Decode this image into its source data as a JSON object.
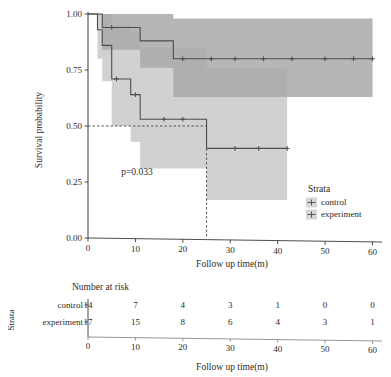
{
  "chart_data": {
    "type": "line",
    "plot_kind": "kaplan-meier-survival",
    "title": "",
    "xlabel": "Follow up time(m)",
    "ylabel": "Survival probability",
    "xlim": [
      0,
      62
    ],
    "ylim": [
      0.0,
      1.0
    ],
    "xticks": [
      0,
      10,
      20,
      30,
      40,
      50,
      60
    ],
    "xtick_labels": [
      "0",
      "10",
      "20",
      "30",
      "40",
      "50",
      "60"
    ],
    "yticks": [
      0.0,
      0.25,
      0.5,
      0.75,
      1.0
    ],
    "ytick_labels": [
      "0.00",
      "0.25",
      "0.50",
      "0.75",
      "1.00"
    ],
    "grid": false,
    "annotations": [
      {
        "name": "p-value",
        "text": "p=0.033",
        "x": 7,
        "y": 0.28
      }
    ],
    "median_reference": {
      "level": 0.5,
      "control_median_time": 25,
      "style": "dashed"
    },
    "legend": {
      "title": "Strata",
      "position": "right-bottom",
      "entries": [
        "control",
        "experiment"
      ]
    },
    "series": [
      {
        "name": "control",
        "color": "#4d4d4d",
        "band_color": "#c9c9c9",
        "steps": [
          {
            "t": 0,
            "s": 1.0
          },
          {
            "t": 2,
            "s": 0.93
          },
          {
            "t": 3,
            "s": 0.86
          },
          {
            "t": 5,
            "s": 0.71
          },
          {
            "t": 9,
            "s": 0.64
          },
          {
            "t": 11,
            "s": 0.53
          },
          {
            "t": 25,
            "s": 0.4
          },
          {
            "t": 42,
            "s": 0.4
          }
        ],
        "ci_lower": [
          {
            "t": 0,
            "s": 1.0
          },
          {
            "t": 2,
            "s": 0.8
          },
          {
            "t": 3,
            "s": 0.7
          },
          {
            "t": 5,
            "s": 0.5
          },
          {
            "t": 9,
            "s": 0.43
          },
          {
            "t": 11,
            "s": 0.31
          },
          {
            "t": 25,
            "s": 0.17
          },
          {
            "t": 42,
            "s": 0.17
          }
        ],
        "ci_upper": [
          {
            "t": 0,
            "s": 1.0
          },
          {
            "t": 2,
            "s": 1.0
          },
          {
            "t": 3,
            "s": 1.0
          },
          {
            "t": 5,
            "s": 0.95
          },
          {
            "t": 9,
            "s": 0.92
          },
          {
            "t": 11,
            "s": 0.85
          },
          {
            "t": 25,
            "s": 0.76
          },
          {
            "t": 42,
            "s": 0.76
          }
        ],
        "censor_times": [
          6,
          10,
          16,
          20,
          31,
          36,
          42
        ]
      },
      {
        "name": "experiment",
        "color": "#4d4d4d",
        "band_color": "#a8a8a8",
        "steps": [
          {
            "t": 0,
            "s": 1.0
          },
          {
            "t": 3,
            "s": 0.94
          },
          {
            "t": 11,
            "s": 0.88
          },
          {
            "t": 18,
            "s": 0.8
          },
          {
            "t": 60,
            "s": 0.8
          }
        ],
        "ci_lower": [
          {
            "t": 0,
            "s": 1.0
          },
          {
            "t": 3,
            "s": 0.84
          },
          {
            "t": 11,
            "s": 0.76
          },
          {
            "t": 18,
            "s": 0.63
          },
          {
            "t": 60,
            "s": 0.63
          }
        ],
        "ci_upper": [
          {
            "t": 0,
            "s": 1.0
          },
          {
            "t": 3,
            "s": 1.0
          },
          {
            "t": 11,
            "s": 1.0
          },
          {
            "t": 18,
            "s": 0.98
          },
          {
            "t": 60,
            "s": 0.98
          }
        ],
        "censor_times": [
          5,
          20,
          26,
          31,
          37,
          43,
          50,
          56,
          60
        ]
      }
    ]
  },
  "risk_table": {
    "title": "Number at risk",
    "strata_axis_label": "Strata",
    "xlabel": "Follow up time(m)",
    "times": [
      0,
      10,
      20,
      30,
      40,
      50,
      60
    ],
    "time_labels": [
      "0",
      "10",
      "20",
      "30",
      "40",
      "50",
      "60"
    ],
    "rows": [
      {
        "label": "control",
        "values": [
          "14",
          "7",
          "4",
          "3",
          "1",
          "0",
          "0"
        ]
      },
      {
        "label": "experiment",
        "values": [
          "17",
          "15",
          "8",
          "6",
          "4",
          "3",
          "1"
        ]
      }
    ]
  },
  "colors": {
    "axis": "#3a3a3a",
    "curve": "#4d4d4d",
    "band_light": "#cfcfcf",
    "band_dark": "#a9a9a9",
    "text": "#2b2b2b"
  }
}
